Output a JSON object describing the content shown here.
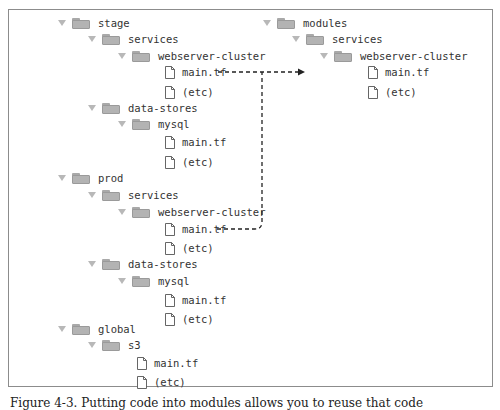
{
  "diagram": {
    "type": "file-tree",
    "left_tree": [
      {
        "label": "stage",
        "kind": "folder",
        "x": 58,
        "y": 15
      },
      {
        "label": "services",
        "kind": "folder",
        "x": 88,
        "y": 31
      },
      {
        "label": "webserver-cluster",
        "kind": "folder",
        "x": 118,
        "y": 48
      },
      {
        "label": "main.tf",
        "kind": "file",
        "x": 165,
        "y": 64
      },
      {
        "label": "(etc)",
        "kind": "file",
        "x": 165,
        "y": 84
      },
      {
        "label": "data-stores",
        "kind": "folder",
        "x": 88,
        "y": 100
      },
      {
        "label": "mysql",
        "kind": "folder",
        "x": 118,
        "y": 116
      },
      {
        "label": "main.tf",
        "kind": "file",
        "x": 165,
        "y": 134
      },
      {
        "label": "(etc)",
        "kind": "file",
        "x": 165,
        "y": 154
      },
      {
        "label": "prod",
        "kind": "folder",
        "x": 58,
        "y": 170
      },
      {
        "label": "services",
        "kind": "folder",
        "x": 88,
        "y": 187
      },
      {
        "label": "webserver-cluster",
        "kind": "folder",
        "x": 118,
        "y": 204
      },
      {
        "label": "main.tf",
        "kind": "file",
        "x": 165,
        "y": 221
      },
      {
        "label": "(etc)",
        "kind": "file",
        "x": 165,
        "y": 240
      },
      {
        "label": "data-stores",
        "kind": "folder",
        "x": 88,
        "y": 256
      },
      {
        "label": "mysql",
        "kind": "folder",
        "x": 118,
        "y": 273
      },
      {
        "label": "main.tf",
        "kind": "file",
        "x": 165,
        "y": 292
      },
      {
        "label": "(etc)",
        "kind": "file",
        "x": 165,
        "y": 311
      },
      {
        "label": "global",
        "kind": "folder",
        "x": 58,
        "y": 321
      },
      {
        "label": "s3",
        "kind": "folder",
        "x": 88,
        "y": 337
      },
      {
        "label": "main.tf",
        "kind": "file",
        "x": 137,
        "y": 355
      },
      {
        "label": "(etc)",
        "kind": "file",
        "x": 137,
        "y": 374
      }
    ],
    "right_tree": [
      {
        "label": "modules",
        "kind": "folder",
        "x": 263,
        "y": 15
      },
      {
        "label": "services",
        "kind": "folder",
        "x": 292,
        "y": 31
      },
      {
        "label": "webserver-cluster",
        "kind": "folder",
        "x": 320,
        "y": 48
      },
      {
        "label": "main.tf",
        "kind": "file",
        "x": 368,
        "y": 64
      },
      {
        "label": "(etc)",
        "kind": "file",
        "x": 368,
        "y": 84
      }
    ],
    "connectors": [
      {
        "from": "stage/services/webserver-cluster/main.tf",
        "to": "modules/services/webserver-cluster/main.tf",
        "style": "dashed",
        "arrow": true
      },
      {
        "from": "prod/services/webserver-cluster/main.tf",
        "to": "modules/services/webserver-cluster/main.tf",
        "style": "dashed",
        "arrow": false
      }
    ],
    "caption": "Figure 4-3. Putting code into modules allows you to reuse that code"
  },
  "colors": {
    "folder": "#b3b3b3",
    "triangle": "#b8b8b8",
    "text": "#333333",
    "frame": "#8c8c8c",
    "connector": "#222222"
  }
}
